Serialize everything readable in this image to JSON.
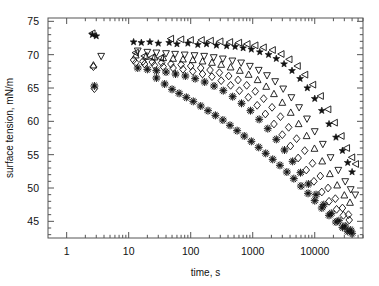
{
  "chart_data": {
    "type": "scatter",
    "title": "",
    "xlabel": "time, s",
    "ylabel": "surface tension, mN/m",
    "xscale": "log",
    "yscale": "linear",
    "xlim": [
      0.5,
      60000
    ],
    "ylim": [
      42.5,
      75.5
    ],
    "grid": false,
    "legend": "none",
    "xticks": [
      1,
      10,
      100,
      1000,
      10000
    ],
    "xtick_labels": [
      "1",
      "10",
      "100",
      "1000",
      "10000"
    ],
    "yticks": [
      45,
      50,
      55,
      60,
      65,
      70,
      75
    ],
    "ytick_labels": [
      "45",
      "50",
      "55",
      "60",
      "65",
      "70",
      "75"
    ],
    "yminor_step": 1,
    "series": [
      {
        "name": "filled-star",
        "marker": "star-filled",
        "color": "#111111",
        "points": [
          [
            2.6,
            73.0
          ],
          [
            3.0,
            72.8
          ],
          [
            12,
            71.9
          ],
          [
            16,
            71.8
          ],
          [
            22,
            71.9
          ],
          [
            30,
            71.7
          ],
          [
            45,
            71.8
          ],
          [
            60,
            71.6
          ],
          [
            90,
            71.7
          ],
          [
            130,
            71.5
          ],
          [
            180,
            71.6
          ],
          [
            260,
            71.4
          ],
          [
            380,
            71.3
          ],
          [
            520,
            71.2
          ],
          [
            700,
            71.0
          ],
          [
            950,
            70.8
          ],
          [
            1300,
            70.4
          ],
          [
            1800,
            70.0
          ],
          [
            2400,
            69.4
          ],
          [
            3200,
            68.6
          ],
          [
            4300,
            67.6
          ],
          [
            5800,
            66.4
          ],
          [
            7600,
            65.0
          ],
          [
            10000,
            63.4
          ],
          [
            13000,
            61.6
          ],
          [
            17000,
            59.6
          ],
          [
            22000,
            57.6
          ],
          [
            28000,
            55.6
          ],
          [
            34000,
            53.8
          ],
          [
            40000,
            52.4
          ]
        ]
      },
      {
        "name": "open-left-triangle",
        "marker": "triangle-left",
        "color": "#111111",
        "points": [
          [
            2.6,
            73.2
          ],
          [
            13,
            70.3
          ],
          [
            18,
            69.8
          ],
          [
            24,
            69.6
          ],
          [
            33,
            69.5
          ],
          [
            48,
            72.4
          ],
          [
            70,
            72.3
          ],
          [
            100,
            72.2
          ],
          [
            150,
            72.2
          ],
          [
            210,
            72.1
          ],
          [
            300,
            72.0
          ],
          [
            430,
            71.9
          ],
          [
            600,
            71.8
          ],
          [
            820,
            71.6
          ],
          [
            1100,
            71.4
          ],
          [
            1500,
            71.1
          ],
          [
            2100,
            70.7
          ],
          [
            2900,
            70.1
          ],
          [
            3900,
            69.3
          ],
          [
            5300,
            68.3
          ],
          [
            7000,
            67.0
          ],
          [
            9400,
            65.5
          ],
          [
            12500,
            63.8
          ],
          [
            16500,
            61.8
          ],
          [
            21000,
            59.8
          ],
          [
            27000,
            57.8
          ],
          [
            33000,
            56.0
          ],
          [
            40000,
            54.6
          ],
          [
            46000,
            53.6
          ]
        ]
      },
      {
        "name": "open-down-triangle",
        "marker": "triangle-down",
        "color": "#111111",
        "points": [
          [
            3.6,
            69.8
          ],
          [
            14,
            70.6
          ],
          [
            20,
            70.4
          ],
          [
            28,
            70.3
          ],
          [
            40,
            70.2
          ],
          [
            56,
            70.1
          ],
          [
            80,
            70.0
          ],
          [
            115,
            69.9
          ],
          [
            165,
            69.8
          ],
          [
            235,
            69.6
          ],
          [
            330,
            69.4
          ],
          [
            470,
            69.1
          ],
          [
            650,
            68.8
          ],
          [
            900,
            68.3
          ],
          [
            1250,
            67.7
          ],
          [
            1700,
            66.9
          ],
          [
            2300,
            66.0
          ],
          [
            3100,
            64.9
          ],
          [
            4200,
            63.6
          ],
          [
            5600,
            62.1
          ],
          [
            7500,
            60.4
          ],
          [
            10000,
            58.5
          ],
          [
            13500,
            56.6
          ],
          [
            18000,
            54.6
          ],
          [
            24000,
            52.7
          ],
          [
            31000,
            51.0
          ],
          [
            38000,
            49.8
          ],
          [
            45000,
            49.0
          ]
        ]
      },
      {
        "name": "open-up-triangle",
        "marker": "triangle-up",
        "color": "#111111",
        "points": [
          [
            2.7,
            68.4
          ],
          [
            13,
            69.9
          ],
          [
            19,
            69.7
          ],
          [
            26,
            69.6
          ],
          [
            36,
            69.5
          ],
          [
            52,
            69.4
          ],
          [
            75,
            69.3
          ],
          [
            108,
            69.2
          ],
          [
            155,
            69.0
          ],
          [
            220,
            68.8
          ],
          [
            310,
            68.5
          ],
          [
            440,
            68.1
          ],
          [
            620,
            67.6
          ],
          [
            860,
            67.0
          ],
          [
            1200,
            66.2
          ],
          [
            1650,
            65.2
          ],
          [
            2200,
            64.1
          ],
          [
            3000,
            62.8
          ],
          [
            4100,
            61.3
          ],
          [
            5500,
            59.6
          ],
          [
            7400,
            57.8
          ],
          [
            9900,
            55.9
          ],
          [
            13200,
            54.0
          ],
          [
            17500,
            52.1
          ],
          [
            23000,
            50.4
          ],
          [
            30000,
            48.9
          ],
          [
            37000,
            47.8
          ]
        ]
      },
      {
        "name": "open-diamond-upper",
        "marker": "diamond",
        "color": "#111111",
        "points": [
          [
            2.7,
            68.2
          ],
          [
            12,
            69.2
          ],
          [
            17,
            69.0
          ],
          [
            24,
            68.9
          ],
          [
            34,
            68.8
          ],
          [
            48,
            68.6
          ],
          [
            70,
            68.5
          ],
          [
            100,
            68.3
          ],
          [
            145,
            68.0
          ],
          [
            205,
            67.7
          ],
          [
            290,
            67.3
          ],
          [
            410,
            66.8
          ],
          [
            580,
            66.2
          ],
          [
            800,
            65.4
          ],
          [
            1100,
            64.5
          ],
          [
            1500,
            63.4
          ],
          [
            2050,
            62.1
          ],
          [
            2800,
            60.7
          ],
          [
            3800,
            59.1
          ],
          [
            5100,
            57.4
          ],
          [
            6900,
            55.6
          ],
          [
            9200,
            53.7
          ],
          [
            12300,
            51.8
          ],
          [
            16400,
            50.0
          ],
          [
            21500,
            48.4
          ],
          [
            28000,
            47.0
          ],
          [
            35000,
            46.0
          ]
        ]
      },
      {
        "name": "open-diamond-lower",
        "marker": "diamond",
        "color": "#111111",
        "points": [
          [
            2.8,
            64.9
          ],
          [
            13,
            68.8
          ],
          [
            18,
            68.6
          ],
          [
            26,
            68.4
          ],
          [
            36,
            68.2
          ],
          [
            52,
            68.0
          ],
          [
            75,
            67.8
          ],
          [
            108,
            67.5
          ],
          [
            155,
            67.1
          ],
          [
            220,
            66.7
          ],
          [
            310,
            66.1
          ],
          [
            440,
            65.4
          ],
          [
            610,
            64.6
          ],
          [
            850,
            63.6
          ],
          [
            1180,
            62.4
          ],
          [
            1600,
            61.1
          ],
          [
            2200,
            59.6
          ],
          [
            3000,
            58.0
          ],
          [
            4050,
            56.3
          ],
          [
            5400,
            54.5
          ],
          [
            7300,
            52.7
          ],
          [
            9700,
            51.0
          ],
          [
            13000,
            49.4
          ],
          [
            17000,
            48.0
          ],
          [
            22500,
            46.8
          ],
          [
            29000,
            45.9
          ],
          [
            36000,
            45.2
          ]
        ]
      },
      {
        "name": "asterisk-upper",
        "marker": "asterisk",
        "color": "#111111",
        "points": [
          [
            2.8,
            65.3
          ],
          [
            14,
            68.0
          ],
          [
            20,
            67.8
          ],
          [
            28,
            67.6
          ],
          [
            40,
            67.4
          ],
          [
            57,
            67.1
          ],
          [
            82,
            66.8
          ],
          [
            118,
            66.4
          ],
          [
            168,
            65.9
          ],
          [
            238,
            65.3
          ],
          [
            335,
            64.6
          ],
          [
            475,
            63.7
          ],
          [
            660,
            62.7
          ],
          [
            920,
            61.6
          ],
          [
            1270,
            60.3
          ],
          [
            1750,
            58.9
          ],
          [
            2400,
            57.3
          ],
          [
            3250,
            55.7
          ],
          [
            4400,
            54.0
          ],
          [
            5900,
            52.3
          ],
          [
            7900,
            50.6
          ],
          [
            10500,
            49.0
          ],
          [
            14000,
            47.5
          ],
          [
            18500,
            46.2
          ],
          [
            24500,
            45.1
          ],
          [
            31000,
            44.3
          ],
          [
            38000,
            43.7
          ]
        ]
      },
      {
        "name": "asterisk-lower",
        "marker": "asterisk",
        "color": "#111111",
        "points": [
          [
            28,
            66.5
          ],
          [
            38,
            65.6
          ],
          [
            50,
            64.8
          ],
          [
            65,
            64.2
          ],
          [
            85,
            63.6
          ],
          [
            110,
            63.0
          ],
          [
            145,
            62.3
          ],
          [
            190,
            61.6
          ],
          [
            250,
            60.9
          ],
          [
            330,
            60.2
          ],
          [
            430,
            59.4
          ],
          [
            560,
            58.6
          ],
          [
            730,
            57.8
          ],
          [
            950,
            57.0
          ],
          [
            1250,
            56.1
          ],
          [
            1620,
            55.2
          ],
          [
            2100,
            54.3
          ],
          [
            2750,
            53.4
          ],
          [
            3550,
            52.4
          ],
          [
            4600,
            51.4
          ],
          [
            6000,
            50.3
          ],
          [
            7800,
            49.2
          ],
          [
            10000,
            48.1
          ],
          [
            13000,
            47.0
          ],
          [
            17000,
            45.9
          ],
          [
            22000,
            44.9
          ],
          [
            28000,
            44.1
          ],
          [
            34000,
            43.5
          ],
          [
            40000,
            43.2
          ]
        ]
      }
    ]
  }
}
